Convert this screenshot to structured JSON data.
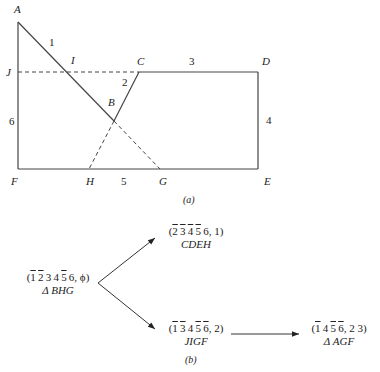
{
  "figure_a": {
    "caption": "(a)",
    "points": {
      "A": {
        "label": "A",
        "x": 18,
        "y": 22
      },
      "J": {
        "label": "J",
        "x": 18,
        "y": 72
      },
      "I": {
        "label": "I",
        "x": 66,
        "y": 72
      },
      "C": {
        "label": "C",
        "x": 139,
        "y": 72
      },
      "D": {
        "label": "D",
        "x": 258,
        "y": 72
      },
      "B": {
        "label": "B",
        "x": 114,
        "y": 121
      },
      "F": {
        "label": "F",
        "x": 18,
        "y": 169
      },
      "H": {
        "label": "H",
        "x": 89,
        "y": 169
      },
      "G": {
        "label": "G",
        "x": 160,
        "y": 169
      },
      "E": {
        "label": "E",
        "x": 258,
        "y": 169
      }
    },
    "edge_labels": {
      "e1": "1",
      "e2": "2",
      "e3": "3",
      "e4": "4",
      "e5": "5",
      "e6": "6"
    }
  },
  "figure_b": {
    "caption": "(b)",
    "nodes": [
      {
        "id": "root",
        "tuple": [
          {
            "t": "1",
            "bar": true
          },
          {
            "t": "2",
            "bar": true
          },
          {
            "t": "3",
            "bar": false
          },
          {
            "t": "4",
            "bar": false
          },
          {
            "t": "5",
            "bar": true
          },
          {
            "t": "6",
            "bar": false
          }
        ],
        "tail": ", ϕ)",
        "sub": "Δ BHG"
      },
      {
        "id": "upper",
        "tuple": [
          {
            "t": "2",
            "bar": true
          },
          {
            "t": "3",
            "bar": true
          },
          {
            "t": "4",
            "bar": true
          },
          {
            "t": "5",
            "bar": true
          },
          {
            "t": "6",
            "bar": false
          }
        ],
        "tail": ", 1)",
        "sub": "CDEH"
      },
      {
        "id": "lower",
        "tuple": [
          {
            "t": "1",
            "bar": true
          },
          {
            "t": "3",
            "bar": true
          },
          {
            "t": "4",
            "bar": false
          },
          {
            "t": "5",
            "bar": true
          },
          {
            "t": "6",
            "bar": true
          }
        ],
        "tail": ", 2)",
        "sub": "JIGF"
      },
      {
        "id": "right",
        "tuple": [
          {
            "t": "1",
            "bar": true
          },
          {
            "t": "4",
            "bar": false
          },
          {
            "t": "5",
            "bar": true
          },
          {
            "t": "6",
            "bar": true
          }
        ],
        "tail": ", 2 3)",
        "sub": "Δ AGF"
      }
    ],
    "edges": [
      {
        "from": "root",
        "to": "upper"
      },
      {
        "from": "root",
        "to": "lower"
      },
      {
        "from": "lower",
        "to": "right"
      }
    ]
  }
}
